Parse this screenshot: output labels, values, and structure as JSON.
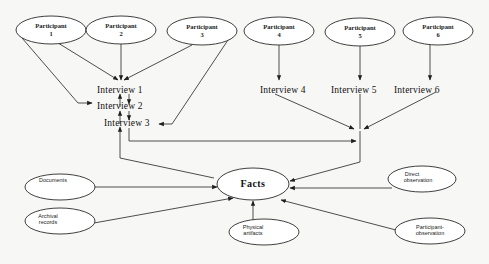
{
  "diagram": {
    "participants": [
      {
        "label_line1": "Participant",
        "label_line2": "1"
      },
      {
        "label_line1": "Participant",
        "label_line2": "2"
      },
      {
        "label_line1": "Participant",
        "label_line2": "3"
      },
      {
        "label_line1": "Participant",
        "label_line2": "4"
      },
      {
        "label_line1": "Participant",
        "label_line2": "5"
      },
      {
        "label_line1": "Participant",
        "label_line2": "6"
      }
    ],
    "interviews": [
      {
        "label": "Interview 1"
      },
      {
        "label": "Interview 2"
      },
      {
        "label": "Interview 3"
      },
      {
        "label": "Interview 4"
      },
      {
        "label": "Interview 5"
      },
      {
        "label": "Interview 6"
      }
    ],
    "center": {
      "label": "Facts"
    },
    "sources": [
      {
        "label_line1": "Documents",
        "label_line2": ""
      },
      {
        "label_line1": "Archival",
        "label_line2": "records"
      },
      {
        "label_line1": "Physical",
        "label_line2": "artifacts"
      },
      {
        "label_line1": "Direct",
        "label_line2": "observation"
      },
      {
        "label_line1": "Participant-",
        "label_line2": "observation"
      }
    ],
    "edges": [
      {
        "from": "Participant 1",
        "to": "Interview 1"
      },
      {
        "from": "Participant 2",
        "to": "Interview 1"
      },
      {
        "from": "Participant 3",
        "to": "Interview 1"
      },
      {
        "from": "Participant 1",
        "to": "Interview 2"
      },
      {
        "from": "Participant 3",
        "to": "Interview 3"
      },
      {
        "from": "Interview 1",
        "to": "Interview 2"
      },
      {
        "from": "Interview 2",
        "to": "Interview 3"
      },
      {
        "from": "Participant 4",
        "to": "Interview 4"
      },
      {
        "from": "Participant 5",
        "to": "Interview 5"
      },
      {
        "from": "Participant 6",
        "to": "Interview 6"
      },
      {
        "from": "Interview 4",
        "to": "Merge point"
      },
      {
        "from": "Interview 5",
        "to": "Merge point"
      },
      {
        "from": "Interview 6",
        "to": "Merge point"
      },
      {
        "from": "Interview 1-3",
        "to": "Merge point"
      },
      {
        "from": "Merge point",
        "to": "Facts"
      },
      {
        "from": "Facts",
        "to": "Interview 1-3"
      },
      {
        "from": "Documents",
        "to": "Facts"
      },
      {
        "from": "Archival records",
        "to": "Facts"
      },
      {
        "from": "Physical artifacts",
        "to": "Facts"
      },
      {
        "from": "Direct observation",
        "to": "Facts"
      },
      {
        "from": "Participant-observation",
        "to": "Facts"
      }
    ]
  }
}
